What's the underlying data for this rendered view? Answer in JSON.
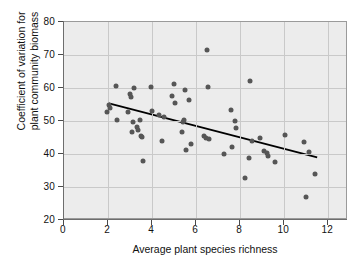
{
  "chart_data": {
    "type": "scatter",
    "title": "",
    "xlabel": "Average plant species richness",
    "ylabel_line1": "Coefficient of variation for",
    "ylabel_line2": "plant community biomass",
    "xlim": [
      0,
      12.9
    ],
    "ylim": [
      20,
      80
    ],
    "xticks": [
      0,
      2,
      4,
      6,
      8,
      10,
      12
    ],
    "yticks": [
      20,
      30,
      40,
      50,
      60,
      70,
      80
    ],
    "grid": true,
    "legend": null,
    "marker_color": "#565656",
    "trendline_color": "#000000",
    "plot_background": "#ececec",
    "points": [
      [
        1.95,
        52.7
      ],
      [
        2.05,
        54.7
      ],
      [
        2.1,
        54.0
      ],
      [
        2.35,
        60.5
      ],
      [
        2.4,
        50.4
      ],
      [
        2.9,
        52.8
      ],
      [
        3.0,
        58.3
      ],
      [
        3.05,
        57.3
      ],
      [
        3.1,
        46.6
      ],
      [
        3.15,
        49.6
      ],
      [
        3.2,
        60.1
      ],
      [
        3.3,
        48.2
      ],
      [
        3.35,
        47.3
      ],
      [
        3.45,
        50.3
      ],
      [
        3.5,
        45.6
      ],
      [
        3.55,
        45.2
      ],
      [
        3.6,
        37.8
      ],
      [
        3.95,
        60.3
      ],
      [
        4.0,
        52.9
      ],
      [
        4.3,
        51.9
      ],
      [
        4.45,
        43.8
      ],
      [
        4.55,
        51.2
      ],
      [
        4.9,
        57.5
      ],
      [
        5.0,
        61.3
      ],
      [
        5.05,
        55.4
      ],
      [
        5.35,
        46.6
      ],
      [
        5.4,
        49.8
      ],
      [
        5.45,
        50.2
      ],
      [
        5.5,
        59.5
      ],
      [
        5.55,
        41.1
      ],
      [
        5.7,
        56.4
      ],
      [
        5.75,
        42.9
      ],
      [
        6.35,
        45.5
      ],
      [
        6.45,
        44.9
      ],
      [
        6.5,
        71.5
      ],
      [
        6.55,
        60.2
      ],
      [
        6.6,
        44.6
      ],
      [
        7.25,
        39.9
      ],
      [
        7.6,
        53.2
      ],
      [
        7.65,
        42.2
      ],
      [
        7.75,
        50.0
      ],
      [
        7.8,
        48.0
      ],
      [
        8.2,
        32.6
      ],
      [
        8.4,
        38.9
      ],
      [
        8.45,
        62.1
      ],
      [
        8.55,
        44.0
      ],
      [
        8.9,
        44.9
      ],
      [
        9.1,
        40.8
      ],
      [
        9.2,
        40.2
      ],
      [
        9.25,
        39.3
      ],
      [
        9.6,
        37.7
      ],
      [
        10.05,
        45.7
      ],
      [
        10.9,
        43.7
      ],
      [
        11.0,
        27.0
      ],
      [
        11.15,
        40.5
      ],
      [
        11.4,
        33.9
      ]
    ],
    "trendline": {
      "x0": 2.0,
      "y0": 55.4,
      "x1": 11.5,
      "y1": 39.0
    }
  }
}
